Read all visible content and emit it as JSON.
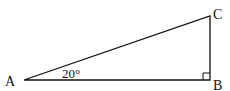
{
  "diagram": {
    "type": "right-triangle",
    "vertices": {
      "A": {
        "label": "A",
        "x": 24,
        "y": 80
      },
      "B": {
        "label": "B",
        "x": 210,
        "y": 80
      },
      "C": {
        "label": "C",
        "x": 210,
        "y": 16
      }
    },
    "angle_label": "20°",
    "right_angle_at": "B",
    "line_color": "#111111"
  }
}
